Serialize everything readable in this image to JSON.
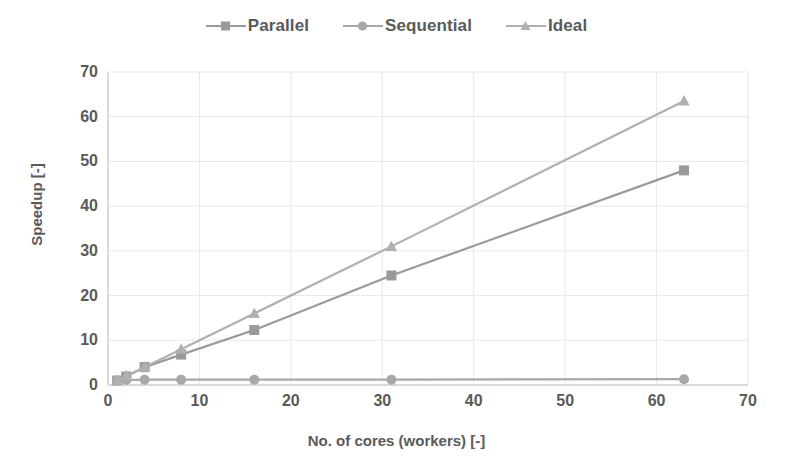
{
  "chart_data": {
    "type": "line",
    "title": "",
    "xlabel": "No. of cores (workers) [-]",
    "ylabel": "Speedup [-]",
    "xlim": [
      0,
      70
    ],
    "ylim": [
      0,
      70
    ],
    "xticks": [
      0,
      10,
      20,
      30,
      40,
      50,
      60,
      70
    ],
    "yticks": [
      0,
      10,
      20,
      30,
      40,
      50,
      60,
      70
    ],
    "grid": true,
    "legend_position": "top-center",
    "x": [
      1,
      2,
      4,
      8,
      16,
      31,
      63
    ],
    "series": [
      {
        "name": "Parallel",
        "marker": "square",
        "color": "#9a9a9a",
        "values": [
          1.0,
          1.9,
          4.0,
          6.8,
          12.3,
          24.5,
          48.0
        ]
      },
      {
        "name": "Sequential",
        "marker": "circle",
        "color": "#a8a8a8",
        "values": [
          1.0,
          1.1,
          1.2,
          1.2,
          1.2,
          1.2,
          1.3
        ]
      },
      {
        "name": "Ideal",
        "marker": "triangle",
        "color": "#b0b0b0",
        "values": [
          1.0,
          2.0,
          4.0,
          8.0,
          16.0,
          31.0,
          63.5
        ]
      }
    ]
  },
  "legend": {
    "entries": [
      {
        "label": "Parallel"
      },
      {
        "label": "Sequential"
      },
      {
        "label": "Ideal"
      }
    ]
  },
  "axes": {
    "x_title": "No. of cores (workers) [-]",
    "y_title": "Speedup [-]",
    "x_tick_labels": [
      "0",
      "10",
      "20",
      "30",
      "40",
      "50",
      "60",
      "70"
    ],
    "y_tick_labels": [
      "0",
      "10",
      "20",
      "30",
      "40",
      "50",
      "60",
      "70"
    ]
  },
  "colors": {
    "grid": "#e8e8e8",
    "axis": "#d0d0d0",
    "text": "#5a5a5a",
    "background": "#ffffff"
  }
}
